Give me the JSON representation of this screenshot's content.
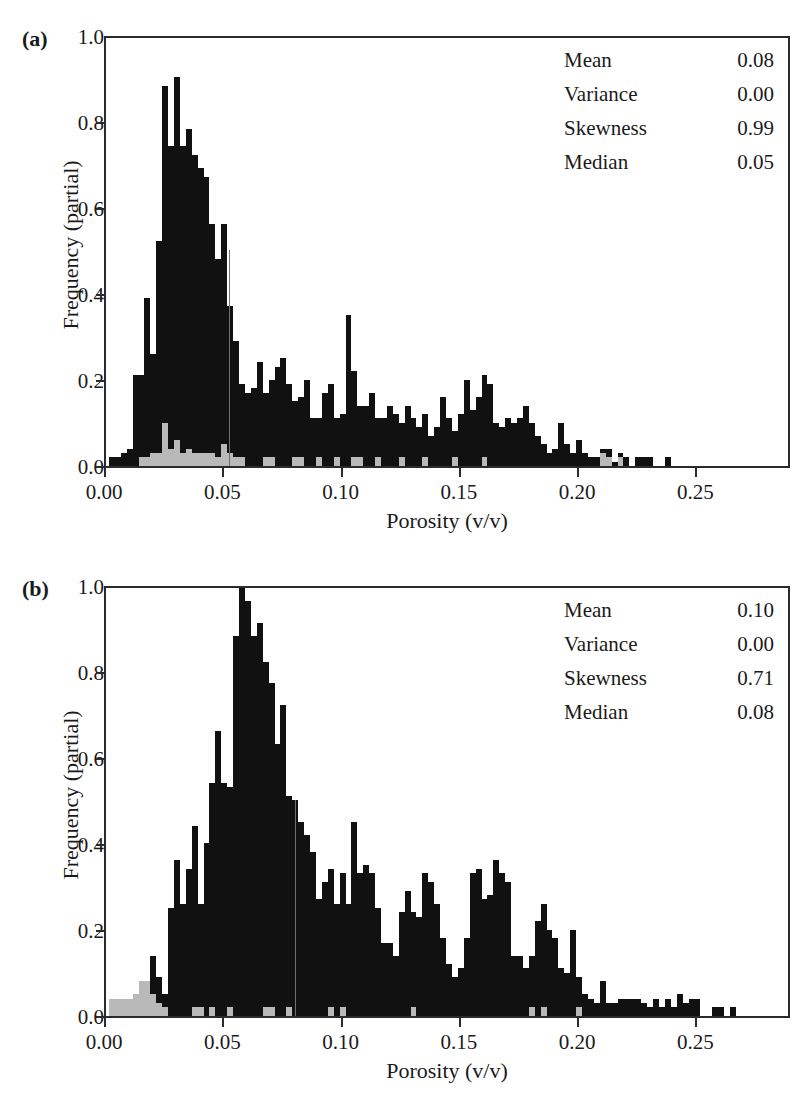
{
  "figure": {
    "axis_titles": {
      "x": "Porosity (v/v)",
      "y": "Frequency (partial)"
    },
    "stats_labels": {
      "mean": "Mean",
      "variance": "Variance",
      "skewness": "Skewness",
      "median": "Median"
    },
    "colors": {
      "bar_primary": "#111111",
      "bar_secondary": "#b9b9b9",
      "axis": "#2b2b2b",
      "median_line": "#6f6f6f"
    }
  },
  "panels": [
    {
      "label": "(a)",
      "stats": {
        "mean": "0.08",
        "variance": "0.00",
        "skewness": "0.99",
        "median": "0.05"
      },
      "ytick_labels": [
        "1.0",
        "0.8",
        "0.6",
        "0.4",
        "0.2",
        "0.0"
      ],
      "xtick_labels": [
        "0.00",
        "0.05",
        "0.10",
        "0.15",
        "0.20",
        "0.25"
      ]
    },
    {
      "label": "(b)",
      "stats": {
        "mean": "0.10",
        "variance": "0.00",
        "skewness": "0.71",
        "median": "0.08"
      },
      "ytick_labels": [
        "1.0",
        "0.8",
        "0.6",
        "0.4",
        "0.2",
        "0.0"
      ],
      "xtick_labels": [
        "0.00",
        "0.05",
        "0.10",
        "0.15",
        "0.20",
        "0.25"
      ]
    }
  ],
  "chart_data": [
    {
      "type": "bar",
      "panel": "(a)",
      "title": "",
      "xlabel": "Porosity (v/v)",
      "ylabel": "Frequency (partial)",
      "xlim": [
        0.0,
        0.29
      ],
      "ylim": [
        0.0,
        1.0
      ],
      "yticks": [
        0.0,
        0.2,
        0.4,
        0.6,
        0.8,
        1.0
      ],
      "xticks": [
        0.0,
        0.05,
        0.1,
        0.15,
        0.2,
        0.25
      ],
      "grid": false,
      "legend": "none",
      "bin_width": 0.0025,
      "annotations": {
        "Mean": 0.08,
        "Variance": 0.0,
        "Skewness": 0.99,
        "Median": 0.05
      },
      "median_marker_x": 0.052,
      "series": [
        {
          "name": "total",
          "color": "#111111",
          "x": [
            0.0025,
            0.005,
            0.0075,
            0.01,
            0.0125,
            0.015,
            0.0175,
            0.02,
            0.0225,
            0.025,
            0.0275,
            0.03,
            0.0325,
            0.035,
            0.0375,
            0.04,
            0.0425,
            0.045,
            0.0475,
            0.05,
            0.0525,
            0.055,
            0.0575,
            0.06,
            0.0625,
            0.065,
            0.0675,
            0.07,
            0.0725,
            0.075,
            0.0775,
            0.08,
            0.0825,
            0.085,
            0.0875,
            0.09,
            0.0925,
            0.095,
            0.0975,
            0.1,
            0.1025,
            0.105,
            0.1075,
            0.11,
            0.1125,
            0.115,
            0.1175,
            0.12,
            0.1225,
            0.125,
            0.1275,
            0.13,
            0.1325,
            0.135,
            0.1375,
            0.14,
            0.1425,
            0.145,
            0.1475,
            0.15,
            0.1525,
            0.155,
            0.1575,
            0.16,
            0.1625,
            0.165,
            0.1675,
            0.17,
            0.1725,
            0.175,
            0.1775,
            0.18,
            0.1825,
            0.185,
            0.1875,
            0.19,
            0.1925,
            0.195,
            0.1975,
            0.2,
            0.2025,
            0.205,
            0.2075,
            0.21,
            0.2125,
            0.215,
            0.2175,
            0.22,
            0.2225,
            0.225,
            0.2275,
            0.23,
            0.2325,
            0.235,
            0.2375,
            0.24,
            0.2425,
            0.245,
            0.2475,
            0.25,
            0.2525,
            0.255,
            0.2575,
            0.26,
            0.2625
          ],
          "values": [
            0.02,
            0.02,
            0.03,
            0.04,
            0.21,
            0.21,
            0.39,
            0.26,
            0.52,
            0.88,
            0.74,
            0.9,
            0.74,
            0.78,
            0.72,
            0.69,
            0.67,
            0.56,
            0.48,
            0.56,
            0.37,
            0.29,
            0.19,
            0.17,
            0.18,
            0.24,
            0.17,
            0.2,
            0.23,
            0.25,
            0.19,
            0.15,
            0.16,
            0.2,
            0.11,
            0.11,
            0.17,
            0.19,
            0.11,
            0.12,
            0.35,
            0.22,
            0.14,
            0.14,
            0.17,
            0.11,
            0.11,
            0.14,
            0.12,
            0.1,
            0.14,
            0.11,
            0.09,
            0.12,
            0.07,
            0.09,
            0.16,
            0.11,
            0.08,
            0.12,
            0.2,
            0.13,
            0.16,
            0.21,
            0.19,
            0.1,
            0.09,
            0.11,
            0.1,
            0.11,
            0.14,
            0.1,
            0.07,
            0.05,
            0.03,
            0.04,
            0.1,
            0.05,
            0.03,
            0.06,
            0.03,
            0.02,
            0.02,
            0.04,
            0.04,
            0.01,
            0.03,
            0.02,
            0.0,
            0.02,
            0.02,
            0.02,
            0.0,
            0.0,
            0.02,
            0.0,
            0.0,
            0.0,
            0.0,
            0.0,
            0.0,
            0.0
          ]
        },
        {
          "name": "subset",
          "color": "#b9b9b9",
          "x": [
            0.015,
            0.0175,
            0.02,
            0.0225,
            0.025,
            0.0275,
            0.03,
            0.0325,
            0.035,
            0.0375,
            0.04,
            0.0425,
            0.045,
            0.0475,
            0.05,
            0.0525,
            0.055,
            0.0575,
            0.0675,
            0.07,
            0.08,
            0.0825,
            0.09,
            0.0975,
            0.105,
            0.1075,
            0.115,
            0.125,
            0.135,
            0.1475,
            0.16,
            0.21,
            0.2125,
            0.2175
          ],
          "values": [
            0.02,
            0.02,
            0.03,
            0.03,
            0.1,
            0.04,
            0.06,
            0.03,
            0.04,
            0.03,
            0.03,
            0.03,
            0.03,
            0.02,
            0.05,
            0.03,
            0.02,
            0.02,
            0.02,
            0.02,
            0.02,
            0.02,
            0.02,
            0.02,
            0.02,
            0.02,
            0.02,
            0.02,
            0.02,
            0.02,
            0.02,
            0.03,
            0.02,
            0.02
          ]
        }
      ]
    },
    {
      "type": "bar",
      "panel": "(b)",
      "title": "",
      "xlabel": "Porosity (v/v)",
      "ylabel": "Frequency (partial)",
      "xlim": [
        0.0,
        0.29
      ],
      "ylim": [
        0.0,
        1.0
      ],
      "yticks": [
        0.0,
        0.2,
        0.4,
        0.6,
        0.8,
        1.0
      ],
      "xticks": [
        0.0,
        0.05,
        0.1,
        0.15,
        0.2,
        0.25
      ],
      "grid": false,
      "legend": "none",
      "bin_width": 0.0025,
      "annotations": {
        "Mean": 0.1,
        "Variance": 0.0,
        "Skewness": 0.71,
        "Median": 0.08
      },
      "median_marker_x": 0.08,
      "series": [
        {
          "name": "total",
          "color": "#111111",
          "x": [
            0.005,
            0.0075,
            0.01,
            0.0125,
            0.015,
            0.0175,
            0.02,
            0.0225,
            0.025,
            0.0275,
            0.03,
            0.0325,
            0.035,
            0.0375,
            0.04,
            0.0425,
            0.045,
            0.0475,
            0.05,
            0.0525,
            0.055,
            0.0575,
            0.06,
            0.0625,
            0.065,
            0.0675,
            0.07,
            0.0725,
            0.075,
            0.0775,
            0.08,
            0.0825,
            0.085,
            0.0875,
            0.09,
            0.0925,
            0.095,
            0.0975,
            0.1,
            0.1025,
            0.105,
            0.1075,
            0.11,
            0.1125,
            0.115,
            0.1175,
            0.12,
            0.1225,
            0.125,
            0.1275,
            0.13,
            0.1325,
            0.135,
            0.1375,
            0.14,
            0.1425,
            0.145,
            0.1475,
            0.15,
            0.1525,
            0.155,
            0.1575,
            0.16,
            0.1625,
            0.165,
            0.1675,
            0.17,
            0.1725,
            0.175,
            0.1775,
            0.18,
            0.1825,
            0.185,
            0.1875,
            0.19,
            0.1925,
            0.195,
            0.1975,
            0.2,
            0.2025,
            0.205,
            0.2075,
            0.21,
            0.2125,
            0.215,
            0.2175,
            0.22,
            0.2225,
            0.225,
            0.2275,
            0.23,
            0.2325,
            0.235,
            0.2375,
            0.24,
            0.2425,
            0.245,
            0.2475,
            0.25,
            0.2525,
            0.255,
            0.2575,
            0.26,
            0.2625,
            0.265,
            0.2675,
            0.27,
            0.2725,
            0.275,
            0.2775,
            0.28
          ],
          "values": [
            0.04,
            0.04,
            0.04,
            0.05,
            0.06,
            0.06,
            0.14,
            0.09,
            0.05,
            0.25,
            0.36,
            0.26,
            0.34,
            0.44,
            0.26,
            0.4,
            0.54,
            0.66,
            0.54,
            0.53,
            0.88,
            0.99,
            0.96,
            0.88,
            0.91,
            0.82,
            0.77,
            0.63,
            0.72,
            0.51,
            0.5,
            0.45,
            0.42,
            0.38,
            0.27,
            0.31,
            0.34,
            0.26,
            0.33,
            0.26,
            0.45,
            0.33,
            0.35,
            0.33,
            0.25,
            0.17,
            0.17,
            0.14,
            0.24,
            0.29,
            0.24,
            0.23,
            0.33,
            0.31,
            0.26,
            0.18,
            0.12,
            0.09,
            0.11,
            0.18,
            0.33,
            0.34,
            0.27,
            0.28,
            0.36,
            0.33,
            0.31,
            0.14,
            0.14,
            0.11,
            0.14,
            0.22,
            0.26,
            0.2,
            0.18,
            0.11,
            0.1,
            0.2,
            0.09,
            0.05,
            0.04,
            0.03,
            0.08,
            0.03,
            0.03,
            0.04,
            0.04,
            0.04,
            0.04,
            0.03,
            0.02,
            0.04,
            0.02,
            0.04,
            0.02,
            0.05,
            0.03,
            0.04,
            0.04,
            0.0,
            0.0,
            0.02,
            0.02,
            0.0,
            0.02,
            0.0,
            0.0,
            0.0,
            0.0,
            0.0,
            0.0,
            0.0,
            0.0
          ]
        },
        {
          "name": "subset",
          "color": "#b9b9b9",
          "x": [
            0.0025,
            0.005,
            0.0075,
            0.01,
            0.0125,
            0.015,
            0.0175,
            0.02,
            0.0225,
            0.025,
            0.0375,
            0.04,
            0.045,
            0.0525,
            0.0675,
            0.07,
            0.0775,
            0.095,
            0.1,
            0.13,
            0.18,
            0.185,
            0.2
          ],
          "values": [
            0.04,
            0.04,
            0.04,
            0.04,
            0.05,
            0.08,
            0.08,
            0.05,
            0.03,
            0.02,
            0.02,
            0.02,
            0.02,
            0.02,
            0.02,
            0.02,
            0.02,
            0.02,
            0.02,
            0.02,
            0.02,
            0.02,
            0.02
          ]
        }
      ]
    }
  ]
}
